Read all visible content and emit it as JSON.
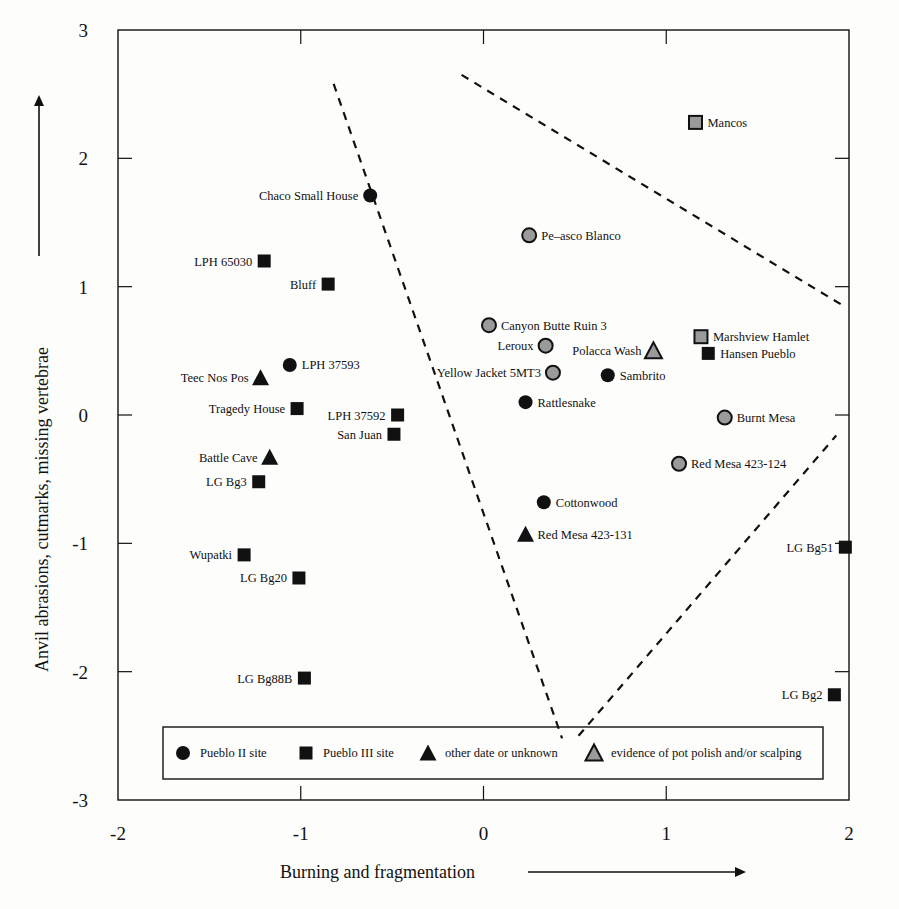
{
  "chart_data": {
    "type": "scatter",
    "title": "",
    "xlabel": "Burning and fragmentation",
    "ylabel": "Anvil abrasions, cutmarks, missing vertebrae",
    "xlim": [
      -2,
      2
    ],
    "ylim": [
      -3,
      3
    ],
    "xticks": [
      "-2",
      "-1",
      "0",
      "1",
      "2"
    ],
    "yticks": [
      "3",
      "2",
      "1",
      "0",
      "-1",
      "-2",
      "-3"
    ],
    "grid": false,
    "legend_position": "bottom-inside",
    "legend": [
      {
        "marker": "circle",
        "fill": "#111111",
        "label": "Pueblo II site"
      },
      {
        "marker": "square",
        "fill": "#111111",
        "label": "Pueblo III site"
      },
      {
        "marker": "triangle",
        "fill": "#111111",
        "label": "other date or unknown"
      },
      {
        "marker": "triangle",
        "fill": "#9a9a9a",
        "label": "evidence of pot polish and/or scalping"
      }
    ],
    "points": [
      {
        "name": "Mancos",
        "x": 1.16,
        "y": 2.28,
        "marker": "square",
        "polish": true,
        "label_side": "right"
      },
      {
        "name": "Chaco Small House",
        "x": -0.62,
        "y": 1.71,
        "marker": "circle",
        "polish": false,
        "label_side": "left"
      },
      {
        "name": "Pe–asco Blanco",
        "x": 0.25,
        "y": 1.4,
        "marker": "circle",
        "polish": true,
        "label_side": "right"
      },
      {
        "name": "LPH 65030",
        "x": -1.2,
        "y": 1.2,
        "marker": "square",
        "polish": false,
        "label_side": "left"
      },
      {
        "name": "Bluff",
        "x": -0.85,
        "y": 1.02,
        "marker": "square",
        "polish": false,
        "label_side": "left"
      },
      {
        "name": "Canyon Butte Ruin 3",
        "x": 0.03,
        "y": 0.7,
        "marker": "circle",
        "polish": true,
        "label_side": "right"
      },
      {
        "name": "Marshview Hamlet",
        "x": 1.19,
        "y": 0.61,
        "marker": "square",
        "polish": true,
        "label_side": "right"
      },
      {
        "name": "Leroux",
        "x": 0.34,
        "y": 0.54,
        "marker": "circle",
        "polish": true,
        "label_side": "left"
      },
      {
        "name": "Polacca Wash",
        "x": 0.93,
        "y": 0.5,
        "marker": "triangle",
        "polish": true,
        "label_side": "left"
      },
      {
        "name": "Hansen Pueblo",
        "x": 1.23,
        "y": 0.48,
        "marker": "square",
        "polish": false,
        "label_side": "right"
      },
      {
        "name": "LPH 37593",
        "x": -1.06,
        "y": 0.39,
        "marker": "circle",
        "polish": false,
        "label_side": "right"
      },
      {
        "name": "Yellow Jacket 5MT3",
        "x": 0.38,
        "y": 0.33,
        "marker": "circle",
        "polish": true,
        "label_side": "left"
      },
      {
        "name": "Sambrito",
        "x": 0.68,
        "y": 0.31,
        "marker": "circle",
        "polish": false,
        "label_side": "right"
      },
      {
        "name": "Teec Nos Pos",
        "x": -1.22,
        "y": 0.29,
        "marker": "triangle",
        "polish": false,
        "label_side": "left"
      },
      {
        "name": "Rattlesnake",
        "x": 0.23,
        "y": 0.1,
        "marker": "circle",
        "polish": false,
        "label_side": "right"
      },
      {
        "name": "Tragedy House",
        "x": -1.02,
        "y": 0.05,
        "marker": "square",
        "polish": false,
        "label_side": "left"
      },
      {
        "name": "LPH 37592",
        "x": -0.47,
        "y": 0.0,
        "marker": "square",
        "polish": false,
        "label_side": "left"
      },
      {
        "name": "Burnt Mesa",
        "x": 1.32,
        "y": -0.02,
        "marker": "circle",
        "polish": true,
        "label_side": "right"
      },
      {
        "name": "San Juan",
        "x": -0.49,
        "y": -0.15,
        "marker": "square",
        "polish": false,
        "label_side": "left"
      },
      {
        "name": "Battle Cave",
        "x": -1.17,
        "y": -0.33,
        "marker": "triangle",
        "polish": false,
        "label_side": "left"
      },
      {
        "name": "Red Mesa 423-124",
        "x": 1.07,
        "y": -0.38,
        "marker": "circle",
        "polish": true,
        "label_side": "right"
      },
      {
        "name": "LG Bg3",
        "x": -1.23,
        "y": -0.52,
        "marker": "square",
        "polish": false,
        "label_side": "left"
      },
      {
        "name": "Cottonwood",
        "x": 0.33,
        "y": -0.68,
        "marker": "circle",
        "polish": false,
        "label_side": "right"
      },
      {
        "name": "Red Mesa 423-131",
        "x": 0.23,
        "y": -0.93,
        "marker": "triangle",
        "polish": false,
        "label_side": "right"
      },
      {
        "name": "LG Bg51",
        "x": 1.98,
        "y": -1.03,
        "marker": "square",
        "polish": false,
        "label_side": "left"
      },
      {
        "name": "Wupatki",
        "x": -1.31,
        "y": -1.09,
        "marker": "square",
        "polish": false,
        "label_side": "left"
      },
      {
        "name": "LG Bg20",
        "x": -1.01,
        "y": -1.27,
        "marker": "square",
        "polish": false,
        "label_side": "left"
      },
      {
        "name": "LG Bg88B",
        "x": -0.98,
        "y": -2.05,
        "marker": "square",
        "polish": false,
        "label_side": "left"
      },
      {
        "name": "LG Bg2",
        "x": 1.92,
        "y": -2.18,
        "marker": "square",
        "polish": false,
        "label_side": "left"
      }
    ],
    "annotations": [
      {
        "type": "dashed-line",
        "from": [
          -0.82,
          2.58
        ],
        "to": [
          0.43,
          -2.52
        ]
      },
      {
        "type": "dashed-line",
        "from": [
          -0.12,
          2.65
        ],
        "to": [
          1.97,
          0.85
        ]
      },
      {
        "type": "dashed-line",
        "from": [
          0.52,
          -2.5
        ],
        "to": [
          1.93,
          -0.16
        ]
      }
    ]
  },
  "colors": {
    "ink": "#111111",
    "polish_fill": "#9a9a9a",
    "background": "#fdfdfc"
  }
}
